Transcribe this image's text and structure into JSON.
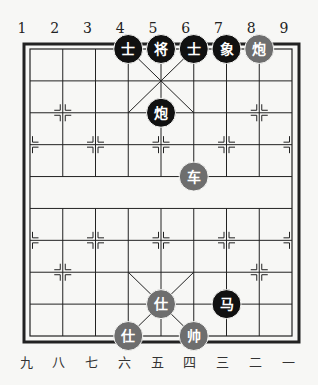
{
  "board": {
    "title": "Xiangqi board position",
    "top_labels": [
      "1",
      "2",
      "3",
      "4",
      "5",
      "6",
      "7",
      "8",
      "9"
    ],
    "bottom_labels": [
      "九",
      "八",
      "七",
      "六",
      "五",
      "四",
      "三",
      "二",
      "一"
    ],
    "colors": {
      "background": "#f7f7f5",
      "line": "#222222",
      "black_piece": "#111111",
      "red_piece": "#6e6e6e",
      "piece_text": "#ffffff"
    }
  },
  "pieces": [
    {
      "side": "black",
      "char": "士",
      "name": "advisor",
      "col": 4,
      "row": 0
    },
    {
      "side": "black",
      "char": "将",
      "name": "general",
      "col": 5,
      "row": 0
    },
    {
      "side": "black",
      "char": "士",
      "name": "advisor",
      "col": 6,
      "row": 0
    },
    {
      "side": "black",
      "char": "象",
      "name": "elephant",
      "col": 7,
      "row": 0
    },
    {
      "side": "red",
      "char": "炮",
      "name": "cannon",
      "col": 8,
      "row": 0
    },
    {
      "side": "black",
      "char": "炮",
      "name": "cannon",
      "col": 5,
      "row": 2
    },
    {
      "side": "red",
      "char": "车",
      "name": "chariot",
      "col": 6,
      "row": 4
    },
    {
      "side": "red",
      "char": "仕",
      "name": "advisor",
      "col": 5,
      "row": 8
    },
    {
      "side": "black",
      "char": "马",
      "name": "horse",
      "col": 7,
      "row": 8
    },
    {
      "side": "red",
      "char": "仕",
      "name": "advisor",
      "col": 4,
      "row": 9
    },
    {
      "side": "red",
      "char": "帅",
      "name": "general",
      "col": 6,
      "row": 9
    }
  ]
}
